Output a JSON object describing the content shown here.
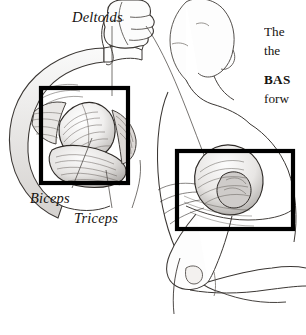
{
  "page": {
    "background_color": "#ffffff",
    "ink_color": "#1a1714",
    "highlight_color": "#000000",
    "width": 306,
    "height": 335
  },
  "figure": {
    "name": "arm-and-shoulder-musculature",
    "labels": [
      {
        "id": "deltoids",
        "text": "Deltoids",
        "x": 72,
        "y": 9
      },
      {
        "id": "biceps",
        "text": "Biceps",
        "x": 30,
        "y": 190
      },
      {
        "id": "triceps",
        "text": "Triceps",
        "x": 74,
        "y": 210
      }
    ],
    "callout_boxes": [
      {
        "id": "arm-highlight-box",
        "x": 41,
        "y": 88,
        "width": 87,
        "height": 95
      },
      {
        "id": "shoulder-highlight-box",
        "x": 177,
        "y": 151,
        "width": 116,
        "height": 78
      }
    ]
  },
  "bodytext": {
    "lines": [
      {
        "text": "The",
        "style": "normal"
      },
      {
        "text": "the",
        "style": "normal"
      },
      {
        "text": "BAS",
        "style": "runhead"
      },
      {
        "text": "forw",
        "style": "normal"
      }
    ]
  }
}
